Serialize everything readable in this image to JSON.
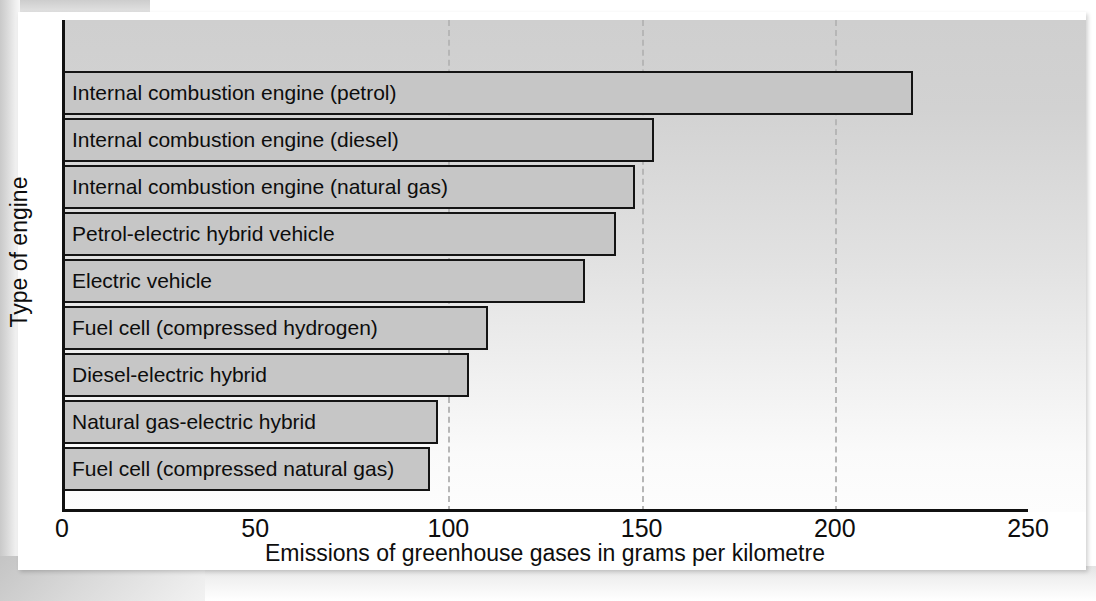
{
  "chart_data": {
    "type": "bar",
    "orientation": "horizontal",
    "title": "",
    "xlabel": "Emissions of greenhouse gases in grams per kilometre",
    "ylabel": "Type of engine",
    "xlim": [
      0,
      250
    ],
    "xticks": [
      "0",
      "50",
      "100",
      "150",
      "200",
      "250"
    ],
    "xtick_values": [
      0,
      50,
      100,
      150,
      200,
      250
    ],
    "grid": "vertical dashed gridlines at 100, 150, 200",
    "legend": "none",
    "categories": [
      "Internal combustion engine (petrol)",
      "Internal combustion engine (diesel)",
      "Internal combustion engine (natural gas)",
      "Petrol-electric hybrid vehicle",
      "Electric vehicle",
      "Fuel cell (compressed hydrogen)",
      "Diesel-electric hybrid",
      "Natural gas-electric hybrid",
      "Fuel cell (compressed natural gas)"
    ],
    "values": [
      220,
      153,
      148,
      143,
      135,
      110,
      105,
      97,
      95
    ],
    "bar_fill_color": "#c6c6c6",
    "bar_edge_color": "#141414",
    "plot_background": "#d2d2d2"
  }
}
